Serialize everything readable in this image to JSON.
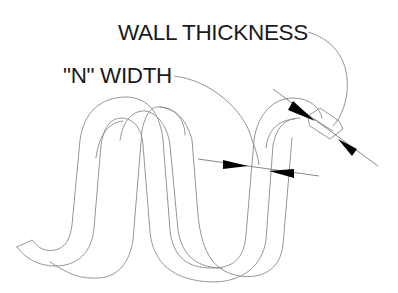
{
  "diagram": {
    "type": "technical-line-drawing",
    "labels": {
      "wall_thickness": "WALL THICKNESS",
      "n_width": "\"N\" WIDTH"
    },
    "colors": {
      "text": "#1a1a1a",
      "outline": "#8a8a8a",
      "leader": "#7a7a7a",
      "arrowhead": "#000000",
      "background": "#ffffff"
    },
    "dimensions": [
      {
        "name": "n-width",
        "label_ref": "n_width",
        "arrows": 2
      },
      {
        "name": "wall-thickness",
        "label_ref": "wall_thickness",
        "arrows": 2
      }
    ]
  }
}
